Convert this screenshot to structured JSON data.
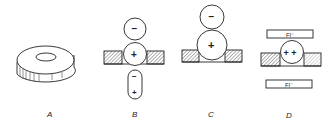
{
  "figure": {
    "panels": [
      {
        "id": "A",
        "label": "A",
        "description": "ring-shaped disk (isometric view)"
      },
      {
        "id": "B",
        "label": "B",
        "symbols": {
          "top_circle": "−",
          "middle_circle": "+",
          "capsule_top": "−",
          "capsule_bottom": "+"
        }
      },
      {
        "id": "C",
        "label": "C",
        "symbols": {
          "top_circle": "−",
          "bottom_circle": "+"
        }
      },
      {
        "id": "D",
        "label": "D",
        "symbols": {
          "circle": "+ +",
          "top_box": "Fl⁻",
          "bottom_box": "Fl⁻"
        }
      }
    ],
    "colors": {
      "stroke": "#222222",
      "hatch": "#555555",
      "background": "#ffffff"
    }
  }
}
